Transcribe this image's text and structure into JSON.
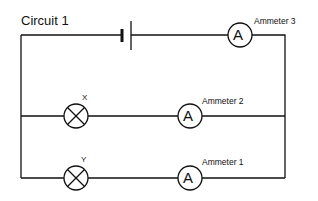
{
  "title": "Circuit 1",
  "components": {
    "battery": {
      "name": "battery"
    },
    "ammeters": [
      {
        "id": "ammeter-3",
        "label": "Ammeter 3",
        "symbol": "A"
      },
      {
        "id": "ammeter-2",
        "label": "Ammeter 2",
        "symbol": "A"
      },
      {
        "id": "ammeter-1",
        "label": "Ammeter 1",
        "symbol": "A"
      }
    ],
    "lamps": [
      {
        "id": "lamp-x",
        "label": "X"
      },
      {
        "id": "lamp-y",
        "label": "Y"
      }
    ]
  },
  "colors": {
    "wire": "#111111",
    "background": "#ffffff"
  }
}
